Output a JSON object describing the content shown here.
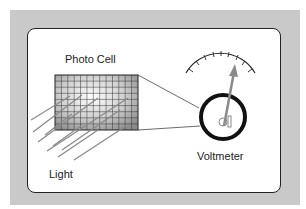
{
  "diagram": {
    "labels": {
      "photo_cell": "Photo Cell",
      "voltmeter": "Voltmeter",
      "light": "Light"
    },
    "colors": {
      "frame": "#c9c9c9",
      "card": "#ffffff",
      "outline": "#222222",
      "needle": "#888888",
      "light_rays": "#8a8a8a"
    },
    "photo_cell_grid": {
      "columns": 13,
      "rows": 9
    },
    "meter_scale_ticks": 9,
    "light_ray_count": 9
  }
}
